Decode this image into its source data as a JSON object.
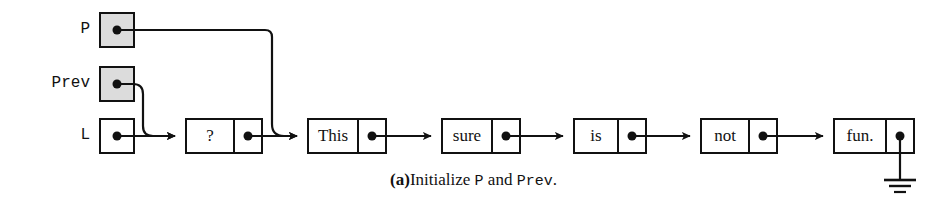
{
  "figure": {
    "type": "linked-list-diagram",
    "background_color": "#ffffff",
    "line_color": "#111111",
    "shaded_fill": "#dcdcdc",
    "unshaded_fill": "#ffffff"
  },
  "pointer_vars": [
    {
      "label": "P",
      "shaded": true,
      "points_to": "This"
    },
    {
      "label": "Prev",
      "shaded": true,
      "points_to": "?"
    },
    {
      "label": "L",
      "shaded": false,
      "points_to": "?"
    }
  ],
  "list": {
    "nodes": [
      {
        "data": "?",
        "next": "This"
      },
      {
        "data": "This",
        "next": "sure"
      },
      {
        "data": "sure",
        "next": "is"
      },
      {
        "data": "is",
        "next": "not"
      },
      {
        "data": "not",
        "next": "fun."
      },
      {
        "data": "fun.",
        "next": "null"
      }
    ],
    "terminator": "ground-symbol"
  },
  "caption": {
    "tag": "(a)",
    "text_before": "Initialize ",
    "mono_1": "P",
    "text_middle": " and ",
    "mono_2": "Prev",
    "text_after": "."
  }
}
